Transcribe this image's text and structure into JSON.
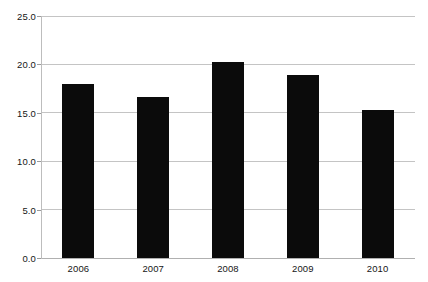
{
  "chart_data": {
    "type": "bar",
    "title": "",
    "subtitle": "",
    "xlabel": "",
    "ylabel": "",
    "categories": [
      "2006",
      "2007",
      "2008",
      "2009",
      "2010"
    ],
    "values": [
      18.0,
      16.6,
      20.2,
      18.9,
      15.3
    ],
    "ylim": [
      0.0,
      25.0
    ],
    "ytick_labels": [
      "0.0",
      "5.0",
      "10.0",
      "15.0",
      "20.0",
      "25.0"
    ],
    "ytick_values": [
      0.0,
      5.0,
      10.0,
      15.0,
      20.0,
      25.0
    ],
    "grid": true,
    "legend": false,
    "legend_position": "none",
    "bar_color": "#0b0b0b",
    "grid_color": "#c4c4c4",
    "axis_color": "#bdbdbd",
    "background_color": "#ffffff",
    "text_color": "#161616"
  }
}
